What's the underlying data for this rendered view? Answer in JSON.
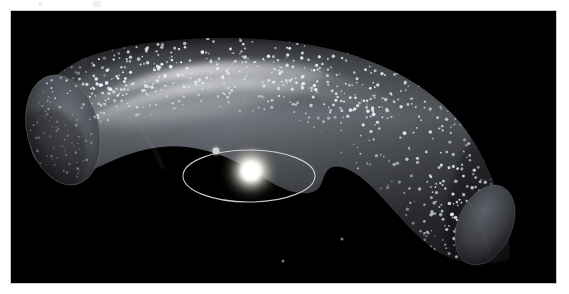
{
  "figure": {
    "caption": "",
    "alt_description": "Artist rendering of a dusty torus (Kuiper Belt) of icy bodies surrounding a central star with an inner planetary orbit",
    "background_color": "#000000",
    "page_color": "#ffffff",
    "border_color": "#c9c9c9"
  },
  "scene": {
    "star": {
      "label": "central-star",
      "center_x": 240,
      "center_y": 160,
      "core_radius": 9,
      "glow_radius": 34,
      "core_color": "#ffffff",
      "glow_color": "#fff6e2"
    },
    "orbit": {
      "label": "planetary-orbit-ellipse",
      "center_x": 238,
      "center_y": 165,
      "radius_x": 66,
      "radius_y": 26,
      "stroke_color": "#d9d9d9",
      "stroke_width": 1.1
    },
    "planet": {
      "label": "orbiting-planet",
      "center_x": 205,
      "center_y": 140,
      "radius": 3.6,
      "color": "#cfcfcf"
    },
    "torus": {
      "label": "kuiper-belt-torus",
      "body_color": "#4a4a4a",
      "bright_band_color": "#c6c8cc",
      "rim_color": "#2a2a2e",
      "particle_color": "#e8eef7",
      "particle_count": 760
    },
    "stray_objects": [
      {
        "label": "stray-object-1",
        "x": 272,
        "y": 250,
        "radius": 1.5
      },
      {
        "label": "stray-object-2",
        "x": 331,
        "y": 228,
        "radius": 1.6
      }
    ]
  },
  "chart_data": {
    "type": "scatter",
    "title": "",
    "xlabel": "",
    "ylabel": ""
  }
}
